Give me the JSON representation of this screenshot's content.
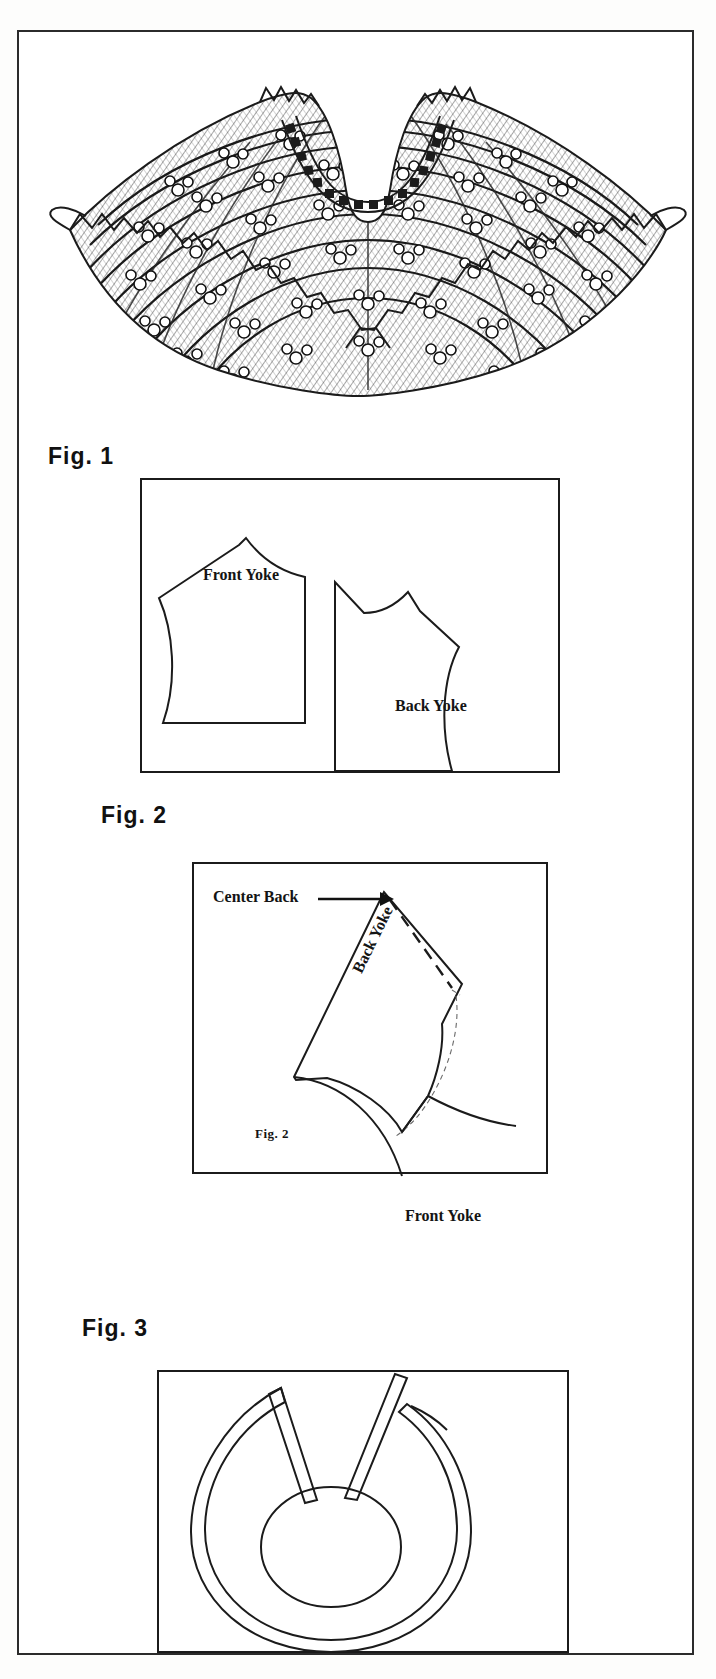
{
  "page": {
    "kind": "sewing-pattern-instruction-sheet",
    "background_color": "#ffffff",
    "ink_color": "#1b1b1b",
    "border": {
      "color": "#2b2b2b",
      "width_px": 2
    }
  },
  "illustration": {
    "name": "crocheted-capelet-illustration",
    "description": "Line-art engraving of a flared, ruffle-edged crocheted capelet with concentric rows of floral motifs and a beaded neckline band",
    "ruffle_points": 26,
    "motif_rows": 8,
    "neckline_beads": 22
  },
  "figures": [
    {
      "id": "fig1",
      "label": "Fig. 1",
      "pieces": [
        {
          "name": "Front Yoke",
          "label": "Front Yoke"
        },
        {
          "name": "Back Yoke",
          "label": "Back Yoke"
        }
      ]
    },
    {
      "id": "fig2",
      "label": "Fig. 2",
      "inner_label": "Fig. 2",
      "annotations": [
        {
          "name": "center-back",
          "label": "Center Back",
          "has_arrow": true
        }
      ],
      "pieces": [
        {
          "name": "Back Yoke",
          "label": "Back Yoke",
          "rotated": true
        },
        {
          "name": "Front Yoke",
          "label": "Front Yoke"
        }
      ]
    },
    {
      "id": "fig3",
      "label": "Fig. 3",
      "pieces": [
        {
          "name": "Circular yoke with two dart slits",
          "label": ""
        }
      ]
    }
  ],
  "labels": {
    "fig1_title": "Fig. 1",
    "fig2_title": "Fig. 2",
    "fig3_title": "Fig. 3",
    "fig2_inner": "Fig. 2",
    "front_yoke": "Front Yoke",
    "back_yoke": "Back Yoke",
    "center_back": "Center Back",
    "fig2_front_yoke": "Front Yoke",
    "fig2_back_yoke": "Back Yoke"
  }
}
